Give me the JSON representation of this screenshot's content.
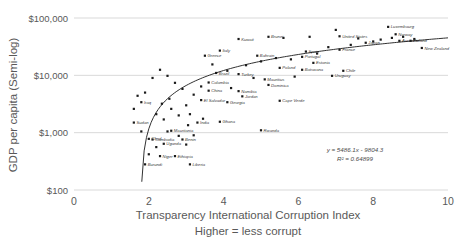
{
  "chart_data": {
    "type": "scatter",
    "title": "",
    "xlabel": "Transparency International Corruption Index",
    "xlabel_sub": "Higher = less corrupt",
    "ylabel": "GDP per capita (Semi-log)",
    "yscale": "log",
    "ylim": [
      100,
      100000
    ],
    "xlim": [
      0,
      10
    ],
    "grid": true,
    "legend": false,
    "yticks": [
      "$100",
      "$1,000",
      "$10,000",
      "$100,000"
    ],
    "ytick_values": [
      100,
      1000,
      10000,
      100000
    ],
    "xticks": [
      "0",
      "2",
      "4",
      "6",
      "8",
      "10"
    ],
    "xtick_values": [
      0,
      2,
      4,
      6,
      8,
      10
    ],
    "annotations": {
      "equation": "y = 5486.1x - 9804.3",
      "r_squared": "R² = 0.64899"
    },
    "trendline": {
      "type": "logarithmic-fit",
      "equation": "y = 5486.1x - 9804.3",
      "r_squared": 0.64899
    },
    "points": [
      {
        "label": "Burundi",
        "x": 1.9,
        "y": 280
      },
      {
        "label": "Liberia",
        "x": 3.1,
        "y": 280
      },
      {
        "label": "Chad",
        "x": 2.0,
        "y": 780
      },
      {
        "label": "Niger",
        "x": 2.3,
        "y": 390
      },
      {
        "label": "Ethiopia",
        "x": 2.7,
        "y": 390
      },
      {
        "label": "Benin",
        "x": 2.9,
        "y": 760
      },
      {
        "label": "Cambodia",
        "x": 2.1,
        "y": 760
      },
      {
        "label": "Mauritania",
        "x": 2.6,
        "y": 1080
      },
      {
        "label": "India",
        "x": 3.3,
        "y": 1500
      },
      {
        "label": "Uganda",
        "x": 2.4,
        "y": 640
      },
      {
        "label": "Iraq",
        "x": 1.8,
        "y": 3400
      },
      {
        "label": "Sudan",
        "x": 1.6,
        "y": 1500
      },
      {
        "label": "Ghana",
        "x": 3.9,
        "y": 1550
      },
      {
        "label": "Rwanda",
        "x": 5.0,
        "y": 1100
      },
      {
        "label": "Cape Verde",
        "x": 5.5,
        "y": 3600
      },
      {
        "label": "Georgia",
        "x": 4.1,
        "y": 3400
      },
      {
        "label": "Jordan",
        "x": 4.5,
        "y": 4300
      },
      {
        "label": "Namibia",
        "x": 4.4,
        "y": 5300
      },
      {
        "label": "China",
        "x": 3.6,
        "y": 5400
      },
      {
        "label": "El Salvador",
        "x": 3.4,
        "y": 3700
      },
      {
        "label": "Colombia",
        "x": 3.6,
        "y": 7500
      },
      {
        "label": "Turkey",
        "x": 4.4,
        "y": 10500
      },
      {
        "label": "Dominica",
        "x": 5.2,
        "y": 6800
      },
      {
        "label": "Mauritius",
        "x": 5.1,
        "y": 8500
      },
      {
        "label": "Uruguay",
        "x": 6.9,
        "y": 9800
      },
      {
        "label": "Chile",
        "x": 7.2,
        "y": 12000
      },
      {
        "label": "Botswana",
        "x": 6.1,
        "y": 12500
      },
      {
        "label": "Poland",
        "x": 5.5,
        "y": 13500
      },
      {
        "label": "Estonia",
        "x": 6.4,
        "y": 16500
      },
      {
        "label": "Portugal",
        "x": 6.1,
        "y": 21000
      },
      {
        "label": "Brazil",
        "x": 3.8,
        "y": 11000
      },
      {
        "label": "Greece",
        "x": 3.5,
        "y": 22000
      },
      {
        "label": "Italy",
        "x": 3.9,
        "y": 27000
      },
      {
        "label": "Spain",
        "x": 6.2,
        "y": 26000
      },
      {
        "label": "France",
        "x": 7.1,
        "y": 28000
      },
      {
        "label": "Bahrain",
        "x": 4.9,
        "y": 22000
      },
      {
        "label": "Kuwait",
        "x": 4.4,
        "y": 43000
      },
      {
        "label": "Brunei",
        "x": 5.2,
        "y": 47000
      },
      {
        "label": "United States",
        "x": 7.1,
        "y": 48000
      },
      {
        "label": "Japan",
        "x": 7.8,
        "y": 37000
      },
      {
        "label": "Luxembourg",
        "x": 8.4,
        "y": 70000
      },
      {
        "label": "Norway",
        "x": 8.6,
        "y": 52000
      },
      {
        "label": "Australia",
        "x": 8.7,
        "y": 40000
      },
      {
        "label": "Finland",
        "x": 9.0,
        "y": 40000
      },
      {
        "label": "New Zealand",
        "x": 9.3,
        "y": 30000
      },
      {
        "label": "Unlabeled",
        "x": 2.5,
        "y": 1050
      },
      {
        "label": "Unlabeled",
        "x": 2.2,
        "y": 2100
      },
      {
        "label": "Unlabeled",
        "x": 2.4,
        "y": 1700
      },
      {
        "label": "Unlabeled",
        "x": 2.6,
        "y": 2600
      },
      {
        "label": "Unlabeled",
        "x": 2.8,
        "y": 2000
      },
      {
        "label": "Unlabeled",
        "x": 3.0,
        "y": 3000
      },
      {
        "label": "Unlabeled",
        "x": 3.1,
        "y": 2100
      },
      {
        "label": "Unlabeled",
        "x": 3.2,
        "y": 4600
      },
      {
        "label": "Unlabeled",
        "x": 3.4,
        "y": 6400
      },
      {
        "label": "Unlabeled",
        "x": 2.9,
        "y": 5800
      },
      {
        "label": "Unlabeled",
        "x": 2.7,
        "y": 7400
      },
      {
        "label": "Unlabeled",
        "x": 2.5,
        "y": 9800
      },
      {
        "label": "Unlabeled",
        "x": 2.3,
        "y": 12500
      },
      {
        "label": "Unlabeled",
        "x": 2.1,
        "y": 9000
      },
      {
        "label": "Unlabeled",
        "x": 1.9,
        "y": 5000
      },
      {
        "label": "Unlabeled",
        "x": 1.8,
        "y": 1050
      },
      {
        "label": "Unlabeled",
        "x": 1.6,
        "y": 2600
      },
      {
        "label": "Unlabeled",
        "x": 1.7,
        "y": 4400
      },
      {
        "label": "Unlabeled",
        "x": 3.7,
        "y": 15500
      },
      {
        "label": "Unlabeled",
        "x": 4.1,
        "y": 12000
      },
      {
        "label": "Unlabeled",
        "x": 4.6,
        "y": 15000
      },
      {
        "label": "Unlabeled",
        "x": 5.0,
        "y": 17500
      },
      {
        "label": "Unlabeled",
        "x": 5.4,
        "y": 20000
      },
      {
        "label": "Unlabeled",
        "x": 5.8,
        "y": 19000
      },
      {
        "label": "Unlabeled",
        "x": 6.5,
        "y": 24000
      },
      {
        "label": "Unlabeled",
        "x": 6.8,
        "y": 31000
      },
      {
        "label": "Unlabeled",
        "x": 7.4,
        "y": 34000
      },
      {
        "label": "Unlabeled",
        "x": 7.6,
        "y": 44000
      },
      {
        "label": "Unlabeled",
        "x": 8.0,
        "y": 39000
      },
      {
        "label": "Unlabeled",
        "x": 8.2,
        "y": 42000
      },
      {
        "label": "Unlabeled",
        "x": 8.5,
        "y": 45000
      },
      {
        "label": "Unlabeled",
        "x": 8.8,
        "y": 47000
      },
      {
        "label": "Unlabeled",
        "x": 9.1,
        "y": 43000
      },
      {
        "label": "Unlabeled",
        "x": 5.6,
        "y": 45000
      },
      {
        "label": "Unlabeled",
        "x": 6.3,
        "y": 47000
      },
      {
        "label": "Unlabeled",
        "x": 7.0,
        "y": 62000
      },
      {
        "label": "Unlabeled",
        "x": 3.0,
        "y": 620
      },
      {
        "label": "Unlabeled",
        "x": 3.2,
        "y": 900
      },
      {
        "label": "Unlabeled",
        "x": 2.8,
        "y": 880
      },
      {
        "label": "Unlabeled",
        "x": 2.2,
        "y": 560
      },
      {
        "label": "Unlabeled",
        "x": 2.0,
        "y": 420
      },
      {
        "label": "Unlabeled",
        "x": 4.8,
        "y": 9000
      },
      {
        "label": "Unlabeled",
        "x": 4.2,
        "y": 6000
      },
      {
        "label": "Unlabeled",
        "x": 5.9,
        "y": 9500
      },
      {
        "label": "Unlabeled",
        "x": 2.55,
        "y": 3900
      },
      {
        "label": "Unlabeled",
        "x": 2.35,
        "y": 3200
      },
      {
        "label": "Unlabeled",
        "x": 3.45,
        "y": 1750
      },
      {
        "label": "Unlabeled",
        "x": 3.05,
        "y": 1350
      }
    ]
  }
}
